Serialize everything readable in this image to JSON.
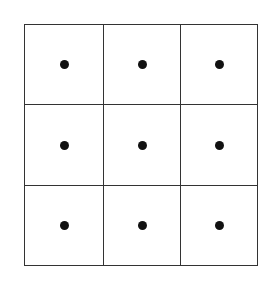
{
  "diagram": {
    "type": "grid-of-dots",
    "rows": 3,
    "columns": 3,
    "line_color": "#333333",
    "dot_color": "#111111",
    "background": "#ffffff",
    "cells": [
      {
        "row": 1,
        "col": 1,
        "dot": true
      },
      {
        "row": 1,
        "col": 2,
        "dot": true
      },
      {
        "row": 1,
        "col": 3,
        "dot": true
      },
      {
        "row": 2,
        "col": 1,
        "dot": true
      },
      {
        "row": 2,
        "col": 2,
        "dot": true
      },
      {
        "row": 2,
        "col": 3,
        "dot": true
      },
      {
        "row": 3,
        "col": 1,
        "dot": true
      },
      {
        "row": 3,
        "col": 2,
        "dot": true
      },
      {
        "row": 3,
        "col": 3,
        "dot": true
      }
    ]
  }
}
